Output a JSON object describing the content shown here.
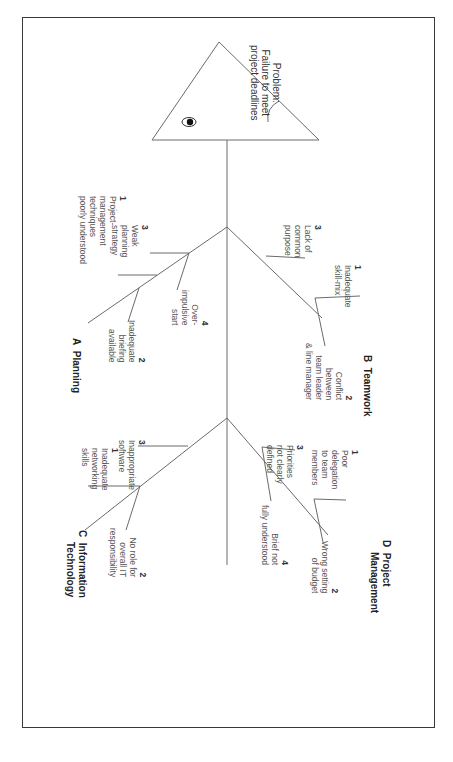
{
  "problem": {
    "label": "Problem:",
    "line1": "Failure to meet",
    "line2": "project deadlines"
  },
  "categories": {
    "A": {
      "letter": "A",
      "name": "Planning"
    },
    "B": {
      "letter": "B",
      "name": "Teamwork"
    },
    "C": {
      "letter": "C",
      "name": "Information",
      "name2": "Technology"
    },
    "D": {
      "letter": "D",
      "name": "Project",
      "name2": "Management"
    }
  },
  "causes": {
    "A1": {
      "num": "1",
      "lines": [
        "Project-",
        "management",
        "techniques",
        "poorly understood"
      ]
    },
    "A2": {
      "num": "2",
      "lines": [
        "Inadequate",
        "briefing",
        "available"
      ]
    },
    "A3": {
      "num": "3",
      "lines": [
        "Weak",
        "planning",
        "strategy"
      ]
    },
    "A4": {
      "num": "4",
      "lines": [
        "Over-",
        "impulsive",
        "start"
      ]
    },
    "B1": {
      "num": "1",
      "lines": [
        "Inadequate",
        "skill-mix"
      ]
    },
    "B2": {
      "num": "2",
      "lines": [
        "Conflict",
        "between",
        "team leader",
        "& line manager"
      ]
    },
    "B3": {
      "num": "3",
      "lines": [
        "Lack of",
        "common",
        "purpose"
      ]
    },
    "C1": {
      "num": "1",
      "lines": [
        "Inadequate",
        "networking",
        "skills"
      ]
    },
    "C2": {
      "num": "2",
      "lines": [
        "No role for",
        "overall IT",
        "responsibility"
      ]
    },
    "C3": {
      "num": "3",
      "lines": [
        "Inappropriate",
        "software"
      ]
    },
    "D1": {
      "num": "1",
      "lines": [
        "Poor",
        "delegation",
        "to team",
        "members"
      ]
    },
    "D2": {
      "num": "2",
      "lines": [
        "Wrong setting",
        "of budget"
      ]
    },
    "D3": {
      "num": "3",
      "lines": [
        "Priorities",
        "not clearly",
        "defined"
      ]
    },
    "D4": {
      "num": "4",
      "lines": [
        "Brief not",
        "fully understood"
      ]
    }
  }
}
